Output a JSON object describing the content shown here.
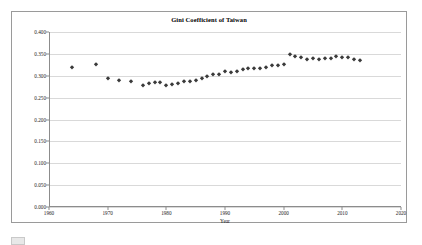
{
  "chart_data": {
    "type": "scatter",
    "title": "Gini Coefficient of Taiwan",
    "xlabel": "Year",
    "ylabel": "",
    "xlim": [
      1960,
      2020
    ],
    "ylim": [
      0.0,
      0.4
    ],
    "grid": true,
    "legend": "none",
    "marker": "small dark diamond",
    "marker_color": "#3a3a3a",
    "xticks": [
      "1960",
      "1970",
      "1980",
      "1990",
      "2000",
      "2010",
      "2020"
    ],
    "xtick_values": [
      1960,
      1970,
      1980,
      1990,
      2000,
      2010,
      2020
    ],
    "yticks": [
      "0.000",
      "0.050",
      "0.100",
      "0.150",
      "0.200",
      "0.250",
      "0.300",
      "0.350",
      "0.400"
    ],
    "ytick_values": [
      0.0,
      0.05,
      0.1,
      0.15,
      0.2,
      0.25,
      0.3,
      0.35,
      0.4
    ],
    "x": [
      1964,
      1968,
      1970,
      1972,
      1974,
      1976,
      1977,
      1978,
      1979,
      1980,
      1981,
      1982,
      1983,
      1984,
      1985,
      1986,
      1987,
      1988,
      1989,
      1990,
      1991,
      1992,
      1993,
      1994,
      1995,
      1996,
      1997,
      1998,
      1999,
      2000,
      2001,
      2002,
      2003,
      2004,
      2005,
      2006,
      2007,
      2008,
      2009,
      2010,
      2011,
      2012,
      2013
    ],
    "values": [
      0.321,
      0.326,
      0.294,
      0.291,
      0.287,
      0.28,
      0.284,
      0.286,
      0.285,
      0.278,
      0.281,
      0.283,
      0.287,
      0.287,
      0.29,
      0.296,
      0.299,
      0.303,
      0.303,
      0.312,
      0.308,
      0.312,
      0.316,
      0.318,
      0.317,
      0.317,
      0.32,
      0.324,
      0.325,
      0.326,
      0.35,
      0.345,
      0.343,
      0.338,
      0.34,
      0.339,
      0.34,
      0.341,
      0.345,
      0.342,
      0.342,
      0.338,
      0.336
    ],
    "series_name": "Gini coefficient"
  },
  "figure": {
    "frame_border_color": "#9a9a9a",
    "background": "#ffffff",
    "gridline_color": "#d9d9d9",
    "axis_color": "#8c8c8c"
  },
  "caption": {
    "swatch_label": "",
    "text": ""
  }
}
